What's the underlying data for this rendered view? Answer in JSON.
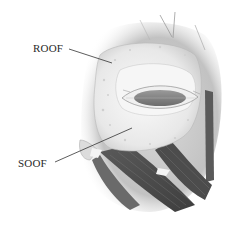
{
  "figure": {
    "type": "anatomical-illustration",
    "labels": [
      {
        "id": "roof",
        "text": "ROOF"
      },
      {
        "id": "soof",
        "text": "SOOF"
      }
    ],
    "colors": {
      "background": "#ffffff",
      "fat_pad": "#eeeeee",
      "fat_pad_shadow": "#c8c8c8",
      "eyeball": "#8a8a8a",
      "muscle_dark": "#4a4a4a",
      "muscle_mid": "#6e6e6e",
      "skin_shadow": "#b0b0b0",
      "leader_line": "#333333",
      "label_text": "#2a2a2a"
    }
  }
}
